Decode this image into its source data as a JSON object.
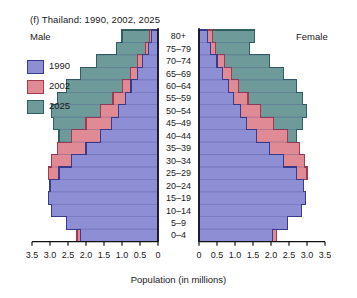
{
  "title": "(f)  Thailand: 1990, 2002, 2025",
  "sides": {
    "left_label": "Male",
    "right_label": "Female"
  },
  "axis": {
    "x_title": "Population (in millions)",
    "left_ticks": [
      "3.5",
      "3.0",
      "2.5",
      "2.0",
      "1.5",
      "1.0",
      "0.5",
      "0"
    ],
    "right_ticks": [
      "0",
      "0.5",
      "1.0",
      "1.5",
      "2.0",
      "2.5",
      "3.0",
      "3.5"
    ],
    "max": 3.5,
    "step": 0.5
  },
  "legend": {
    "items": [
      {
        "label": "1990",
        "color": "#8e8ed4",
        "edge": "#3a3a8c"
      },
      {
        "label": "2002",
        "color": "#e08a96",
        "edge": "#a33b4e"
      },
      {
        "label": "2025",
        "color": "#6f9a9a",
        "edge": "#2f5f5f"
      }
    ]
  },
  "colors": {
    "fill_1990": "#8e8ed4",
    "fill_2002": "#e08a96",
    "fill_2025": "#6f9a9a",
    "edge_1990": "#3a3a8c",
    "edge_2002": "#a33b4e",
    "edge_2025": "#2f5f5f",
    "axis": "#111111",
    "gridline": "#3a3a8c",
    "background": "#ffffff"
  },
  "chart_data": {
    "type": "bar",
    "subtype": "population-pyramid",
    "title": "(f)  Thailand: 1990, 2002, 2025",
    "xlabel": "Population (in millions)",
    "ylabel": "",
    "xlim": [
      0,
      3.5
    ],
    "grid": true,
    "legend_position": "left",
    "units": "millions",
    "age_groups": [
      "0–4",
      "5–9",
      "10–14",
      "15–19",
      "20–24",
      "25–29",
      "30–34",
      "35–39",
      "40–44",
      "45–49",
      "50–54",
      "55–59",
      "60–64",
      "65–69",
      "70–74",
      "75–79",
      "80+"
    ],
    "series": [
      {
        "name": "1990",
        "color": "#8e8ed4",
        "male": [
          2.15,
          2.55,
          2.95,
          3.05,
          3.0,
          2.75,
          2.4,
          2.0,
          1.6,
          1.3,
          1.1,
          0.9,
          0.75,
          0.58,
          0.42,
          0.26,
          0.18
        ],
        "female": [
          2.05,
          2.45,
          2.85,
          2.95,
          2.9,
          2.7,
          2.35,
          1.95,
          1.6,
          1.32,
          1.15,
          0.96,
          0.82,
          0.66,
          0.5,
          0.32,
          0.24
        ]
      },
      {
        "name": "2002",
        "color": "#e08a96",
        "male": [
          2.25,
          2.3,
          2.55,
          2.8,
          3.0,
          3.05,
          2.95,
          2.8,
          2.4,
          2.0,
          1.6,
          1.25,
          0.98,
          0.76,
          0.56,
          0.34,
          0.24
        ],
        "female": [
          2.15,
          2.2,
          2.45,
          2.7,
          2.9,
          3.0,
          2.92,
          2.8,
          2.45,
          2.08,
          1.7,
          1.36,
          1.1,
          0.9,
          0.7,
          0.46,
          0.38
        ]
      },
      {
        "name": "2025",
        "color": "#6f9a9a",
        "male": [
          1.85,
          1.9,
          2.0,
          2.15,
          2.3,
          2.4,
          2.5,
          2.6,
          2.75,
          2.9,
          2.95,
          2.8,
          2.55,
          2.15,
          1.7,
          1.15,
          1.0
        ],
        "female": [
          1.78,
          1.82,
          1.92,
          2.05,
          2.2,
          2.3,
          2.42,
          2.55,
          2.7,
          2.88,
          2.98,
          2.88,
          2.7,
          2.35,
          1.95,
          1.4,
          1.55
        ]
      }
    ]
  }
}
